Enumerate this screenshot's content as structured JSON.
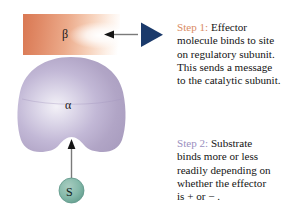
{
  "figure": {
    "background_color": "#ffffff"
  },
  "subunits": {
    "regulatory": {
      "label": "β",
      "name": "regulatory subunit",
      "color_left": "#e08a62",
      "color_right": "#ffffff",
      "shape": "rectangle-with-notch"
    },
    "catalytic": {
      "label": "α",
      "name": "catalytic subunit",
      "color": "#b3a8cc",
      "highlight": "#efecf5",
      "shape": "rounded-apple-with-bottom-notch"
    }
  },
  "effector": {
    "name": "effector molecule",
    "shape": "triangle",
    "color": "#1b3a6b",
    "direction": "left"
  },
  "substrate": {
    "label": "S",
    "name": "substrate",
    "color": "#7ab3a4",
    "border_color": "#4e8578",
    "shape": "circle"
  },
  "arrows": {
    "effector_arrow": {
      "name": "effector-binding-arrow",
      "direction": "left",
      "color": "#6b6b6b"
    },
    "substrate_arrow": {
      "name": "substrate-binding-arrow",
      "direction": "up",
      "color": "#6b6b6b"
    }
  },
  "captions": {
    "step1": {
      "tag": "Step 1:",
      "body": " Effector\nmolecule binds to site\non regulatory subunit.\nThis sends a message\nto the catalytic subunit.",
      "tag_color": "#d98b63"
    },
    "step2": {
      "tag": "Step 2:",
      "body": " Substrate\nbinds more or less\nreadily depending on\nwhether the effector\nis + or − .",
      "tag_color": "#9a8fc0"
    }
  }
}
